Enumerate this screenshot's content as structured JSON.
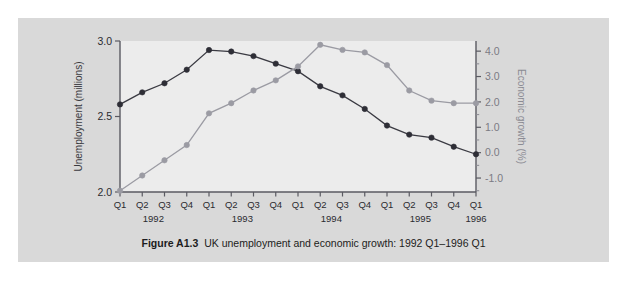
{
  "figure": {
    "caption_label": "Figure A1.3",
    "caption_text": "UK unemployment and economic growth: 1992 Q1–1996 Q1"
  },
  "colors": {
    "page_background": "#ffffff",
    "card_background": "#d9d9d9",
    "plot_background": "#ececec",
    "unemployment_series": "#2e2e36",
    "growth_series": "#9b9ba3",
    "axis": "#5a5a62"
  },
  "chart_data": {
    "type": "line",
    "title": "UK unemployment and economic growth: 1992 Q1–1996 Q1",
    "xlabel": "",
    "grid": false,
    "legend": "none",
    "categories": [
      "Q1",
      "Q2",
      "Q3",
      "Q4",
      "Q1",
      "Q2",
      "Q3",
      "Q4",
      "Q1",
      "Q2",
      "Q3",
      "Q4",
      "Q1",
      "Q2",
      "Q3",
      "Q4",
      "Q1"
    ],
    "year_groups": [
      {
        "label": "1992",
        "start_index": 0,
        "end_index": 3
      },
      {
        "label": "1993",
        "start_index": 4,
        "end_index": 7
      },
      {
        "label": "1994",
        "start_index": 8,
        "end_index": 11
      },
      {
        "label": "1995",
        "start_index": 12,
        "end_index": 15
      },
      {
        "label": "1996",
        "start_index": 16,
        "end_index": 16
      }
    ],
    "axes": {
      "left": {
        "label": "Unemployment (millions)",
        "ticks": [
          "2.0",
          "2.5",
          "3.0"
        ],
        "tick_values": [
          2.0,
          2.5,
          3.0
        ],
        "ylim": [
          2.0,
          3.0
        ]
      },
      "right": {
        "label": "Economic growth (%)",
        "ticks": [
          "-1.0",
          "0.0",
          "1.0",
          "2.0",
          "3.0",
          "4.0"
        ],
        "tick_values": [
          -1.0,
          0.0,
          1.0,
          2.0,
          3.0,
          4.0
        ],
        "ylim": [
          -1.55,
          4.4
        ]
      }
    },
    "series": [
      {
        "name": "Unemployment (millions)",
        "axis": "left",
        "color": "#2e2e36",
        "values": [
          2.58,
          2.66,
          2.72,
          2.81,
          2.94,
          2.93,
          2.9,
          2.85,
          2.8,
          2.7,
          2.64,
          2.55,
          2.44,
          2.38,
          2.36,
          2.3,
          2.25
        ]
      },
      {
        "name": "Economic growth (%)",
        "axis": "right",
        "color": "#9b9ba3",
        "values": [
          -1.5,
          -0.9,
          -0.3,
          0.3,
          1.55,
          1.95,
          2.45,
          2.85,
          3.4,
          4.25,
          4.05,
          3.95,
          3.45,
          2.45,
          2.05,
          1.95,
          1.95
        ]
      }
    ]
  }
}
